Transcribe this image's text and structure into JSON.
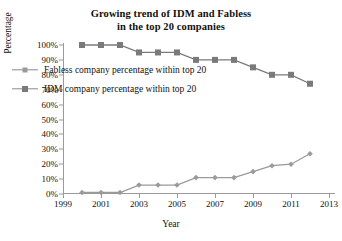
{
  "chart_data": {
    "type": "line",
    "title": "Growing trend of IDM and Fabless in the top 20 companies",
    "title_line1": "Growing trend of IDM and Fabless",
    "title_line2": "in the top 20 companies",
    "xlabel": "Year",
    "ylabel": "Percentage",
    "xlim": [
      1999,
      2013
    ],
    "ylim": [
      0,
      100
    ],
    "xticks": [
      1999,
      2001,
      2003,
      2005,
      2007,
      2009,
      2011,
      2013
    ],
    "xtick_labels": [
      "1999",
      "2001",
      "2003",
      "2005",
      "2007",
      "2009",
      "2011",
      "2013"
    ],
    "yticks": [
      0,
      10,
      20,
      30,
      40,
      50,
      60,
      70,
      80,
      90,
      100
    ],
    "ytick_labels": [
      "0%",
      "10%",
      "20%",
      "30%",
      "40%",
      "50%",
      "60%",
      "70%",
      "80%",
      "90%",
      "100%"
    ],
    "grid": false,
    "legend_position": "center-left",
    "x": [
      2000,
      2001,
      2002,
      2003,
      2004,
      2005,
      2006,
      2007,
      2008,
      2009,
      2010,
      2011,
      2012
    ],
    "series": [
      {
        "name": "Fabless company percentage within top 20",
        "marker": "diamond",
        "color": "#9a9a9a",
        "values": [
          1,
          1,
          1,
          6,
          6,
          6,
          11,
          11,
          11,
          15,
          19,
          20,
          27
        ]
      },
      {
        "name": "IDM company percentage within top 20",
        "marker": "square",
        "color": "#7a7a7a",
        "values": [
          100,
          100,
          100,
          95,
          95,
          95,
          90,
          90,
          90,
          85,
          80,
          80,
          74
        ]
      }
    ]
  },
  "legend": {
    "items": [
      {
        "label": "Fabless company percentage within top 20",
        "marker": "diamond-marker"
      },
      {
        "label": "IDM company percentage within top 20",
        "marker": "square-marker"
      }
    ]
  }
}
